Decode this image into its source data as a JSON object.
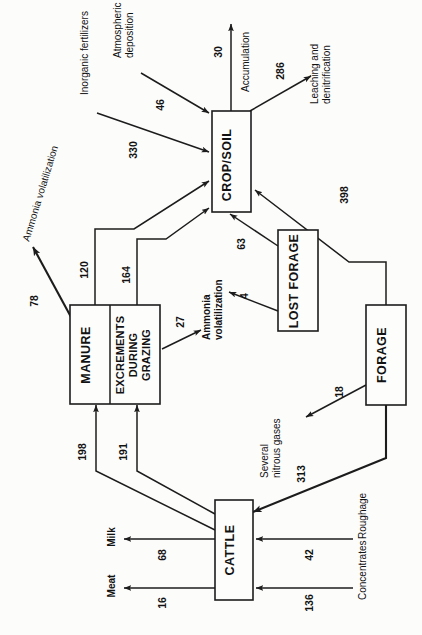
{
  "diagram": {
    "orientation": "rotated-90-counterclockwise",
    "units": "kg N per hectare",
    "nodes": [
      {
        "id": "crop_soil",
        "label": "CROP/SOIL"
      },
      {
        "id": "manure",
        "label": "MANURE"
      },
      {
        "id": "excrements",
        "label": "EXCREMENTS DURING GRAZING",
        "lines": [
          "EXCREMENTS",
          "DURING",
          "GRAZING"
        ]
      },
      {
        "id": "lost_forage",
        "label": "LOST FORAGE"
      },
      {
        "id": "forage",
        "label": "FORAGE"
      },
      {
        "id": "cattle",
        "label": "CATTLE"
      }
    ],
    "external_labels": [
      {
        "id": "inorganic_fertilizers",
        "label": "Inorganic fertilizers"
      },
      {
        "id": "atmospheric_deposition",
        "label": "Atmospheric deposition",
        "lines": [
          "Atmospheric",
          "deposition"
        ]
      },
      {
        "id": "accumulation",
        "label": "Accumulation"
      },
      {
        "id": "leaching_denitrification",
        "label": "Leaching and denitrification",
        "lines": [
          "Leaching and",
          "denitrification"
        ]
      },
      {
        "id": "ammonia_volatilization_manure",
        "label": "Ammonia volatilization"
      },
      {
        "id": "ammonia_volatilization_grazing",
        "label": "Ammonia volatilization",
        "lines": [
          "Ammonia",
          "volatilization"
        ]
      },
      {
        "id": "several_nitrous_gases",
        "label": "Several nitrous gases",
        "lines": [
          "Several",
          "nitrous gases"
        ]
      },
      {
        "id": "milk",
        "label": "Milk"
      },
      {
        "id": "meat",
        "label": "Meat"
      },
      {
        "id": "roughage",
        "label": "Roughage"
      },
      {
        "id": "concentrates",
        "label": "Concentrates"
      }
    ],
    "flows": [
      {
        "id": "f_deposition",
        "value": "46",
        "from": "atmospheric_deposition",
        "to": "crop_soil"
      },
      {
        "id": "f_fertilizer",
        "value": "330",
        "from": "inorganic_fertilizers",
        "to": "crop_soil"
      },
      {
        "id": "f_manure",
        "value": "120",
        "from": "manure",
        "to": "crop_soil"
      },
      {
        "id": "f_excrements",
        "value": "164",
        "from": "excrements",
        "to": "crop_soil"
      },
      {
        "id": "f_lostforage",
        "value": "63",
        "from": "lost_forage",
        "to": "crop_soil"
      },
      {
        "id": "f_forage_in",
        "value": "398",
        "from": "forage",
        "to": "crop_soil"
      },
      {
        "id": "f_accum",
        "value": "30",
        "from": "crop_soil",
        "to": "accumulation"
      },
      {
        "id": "f_leach",
        "value": "286",
        "from": "crop_soil",
        "to": "leaching_denitrification"
      },
      {
        "id": "f_ammonia_manure",
        "value": "78",
        "from": "manure",
        "to": "ammonia_volatilization_manure"
      },
      {
        "id": "f_ammonia_graz",
        "value": "27",
        "from": "excrements",
        "to": "ammonia_volatilization_grazing"
      },
      {
        "id": "f_ammonia_lost",
        "value": "4",
        "from": "lost_forage",
        "to": "ammonia_volatilization_grazing"
      },
      {
        "id": "f_nitrous",
        "value": "18",
        "from": "forage",
        "to": "several_nitrous_gases"
      },
      {
        "id": "f_cattle_manure",
        "value": "198",
        "from": "cattle",
        "to": "manure"
      },
      {
        "id": "f_cattle_excr",
        "value": "191",
        "from": "cattle",
        "to": "excrements"
      },
      {
        "id": "f_forage_cattle",
        "value": "313",
        "from": "forage",
        "to": "cattle"
      },
      {
        "id": "f_milk",
        "value": "68",
        "from": "cattle",
        "to": "milk"
      },
      {
        "id": "f_meat",
        "value": "16",
        "from": "cattle",
        "to": "meat"
      },
      {
        "id": "f_roughage",
        "value": "42",
        "from": "roughage",
        "to": "cattle"
      },
      {
        "id": "f_concentrates",
        "value": "136",
        "from": "concentrates",
        "to": "cattle"
      }
    ],
    "colors": {
      "stroke": "#1c1c1c",
      "fill": "#fdfdfc",
      "background": "#fcfcfb"
    }
  }
}
